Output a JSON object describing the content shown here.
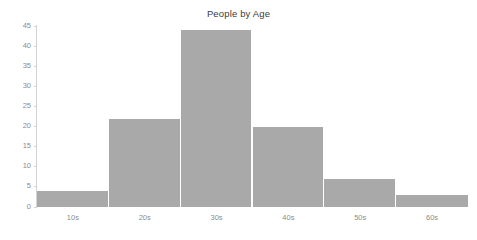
{
  "chart_data": {
    "type": "bar",
    "title": "People by Age",
    "xlabel": "",
    "ylabel": "",
    "categories": [
      "10s",
      "20s",
      "30s",
      "40s",
      "50s",
      "60s"
    ],
    "values": [
      4,
      22,
      44,
      20,
      7,
      3
    ],
    "ylim": [
      0,
      45
    ],
    "yticks": [
      0,
      5,
      10,
      15,
      20,
      25,
      30,
      35,
      40,
      45
    ],
    "ytick_labels": [
      "0",
      "5",
      "10",
      "15",
      "20",
      "25",
      "30",
      "35",
      "40",
      "45"
    ],
    "grid": false,
    "legend": null,
    "legend_position": "none",
    "series": [
      {
        "name": "People",
        "values": [
          4,
          22,
          44,
          20,
          7,
          3
        ]
      }
    ],
    "colors": {
      "bar_fill": "#a9a9a9",
      "bar_separator": "#ffffff",
      "axis_line": "#d4d4d4",
      "tick_label": "#8c8c8c",
      "title_text": "#3b3b3b",
      "background": "#ffffff"
    }
  }
}
